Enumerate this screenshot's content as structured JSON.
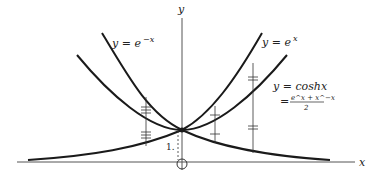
{
  "diagram": {
    "axes": {
      "x_label": "x",
      "y_label": "y",
      "origin_marker": "circle"
    },
    "curves": [
      {
        "id": "exp_neg",
        "label_prefix": "y = e",
        "label_sup": "−x"
      },
      {
        "id": "exp_pos",
        "label_prefix": "y = e",
        "label_sup": "x"
      },
      {
        "id": "cosh",
        "label_line1": "y = coshx",
        "label_eq": "=",
        "frac_num": "e^x + x^−x",
        "frac_den": "2"
      }
    ],
    "annotations": {
      "unit_label": "1."
    },
    "colors": {
      "curve": "#1a1a1a",
      "axis": "#555555",
      "background": "#ffffff"
    }
  }
}
